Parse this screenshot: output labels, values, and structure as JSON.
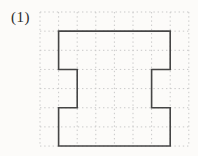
{
  "figure": {
    "label": "(1)",
    "colors": {
      "background": "#fcfbf9",
      "grid_line": "#c9c9c9",
      "shape_outline": "#454545",
      "label_text": "#2b2b2b"
    },
    "grid": {
      "x_start": 40,
      "y_start": 12,
      "cols": 8,
      "rows": 7,
      "cell_width": 18.6,
      "cell_height": 19.15,
      "line_style": "dotted",
      "line_width": 1,
      "dash_pattern": "1.4 2.8"
    },
    "shape": {
      "type": "polygon",
      "description": "6x6-cell square with 1x2-cell rectangular notches cut into the middle of the left and right sides",
      "fill": "none",
      "stroke_width": 1.6,
      "vertices_grid_units": [
        [
          1,
          1
        ],
        [
          7,
          1
        ],
        [
          7,
          3
        ],
        [
          6,
          3
        ],
        [
          6,
          5
        ],
        [
          7,
          5
        ],
        [
          7,
          7
        ],
        [
          1,
          7
        ],
        [
          1,
          5
        ],
        [
          2,
          5
        ],
        [
          2,
          3
        ],
        [
          1,
          3
        ]
      ]
    }
  }
}
